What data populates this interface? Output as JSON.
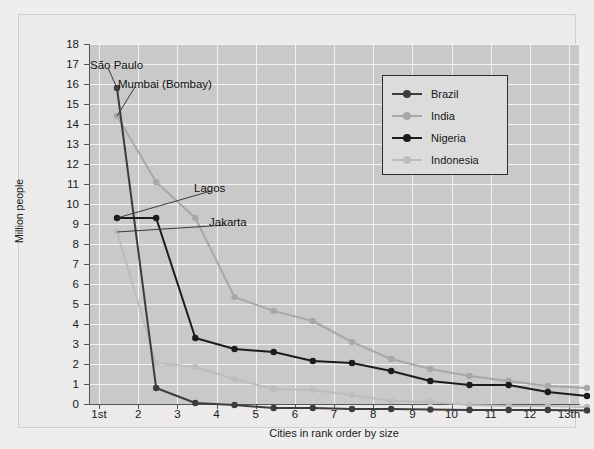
{
  "chart_data": {
    "type": "line",
    "title": "",
    "xlabel": "Cities in rank order by size",
    "ylabel": "Million people",
    "ylim": [
      0,
      18
    ],
    "ytick_step": 1,
    "grid": true,
    "legend_position": "upper-right",
    "categories": [
      "1st",
      "2",
      "3",
      "4",
      "5",
      "6",
      "7",
      "8",
      "9",
      "10",
      "11",
      "12",
      "13th"
    ],
    "series": [
      {
        "name": "Brazil",
        "color": "#3d3d3d",
        "values": [
          16.5,
          1.5,
          0.75,
          0.65,
          0.5,
          0.5,
          0.45,
          0.45,
          0.42,
          0.4,
          0.4,
          0.4,
          0.38
        ]
      },
      {
        "name": "India",
        "color": "#a8a8a8",
        "values": [
          15.1,
          11.8,
          10.0,
          6.05,
          5.35,
          4.85,
          3.8,
          2.95,
          2.45,
          2.1,
          1.85,
          1.6,
          1.5
        ]
      },
      {
        "name": "Nigeria",
        "color": "#1c1c1c",
        "values": [
          10.0,
          10.0,
          4.0,
          3.45,
          3.3,
          2.85,
          2.75,
          2.35,
          1.85,
          1.65,
          1.65,
          1.3,
          1.1
        ]
      },
      {
        "name": "Indonesia",
        "color": "#bdbdbd",
        "values": [
          9.3,
          2.75,
          2.55,
          1.95,
          1.45,
          1.4,
          1.15,
          0.85,
          0.8,
          0.65,
          0.6,
          0.6,
          0.55
        ]
      }
    ],
    "annotations": [
      {
        "text": "São Paulo",
        "series": "Brazil",
        "point_index": 0
      },
      {
        "text": "Mumbai (Bombay)",
        "series": "India",
        "point_index": 0
      },
      {
        "text": "Lagos",
        "series": "Nigeria",
        "point_index": 0
      },
      {
        "text": "Jakarta",
        "series": "Indonesia",
        "point_index": 0
      }
    ]
  },
  "ytick_labels": [
    "0",
    "1",
    "2",
    "3",
    "4",
    "5",
    "6",
    "7",
    "8",
    "9",
    "10",
    "11",
    "12",
    "13",
    "14",
    "15",
    "16",
    "17",
    "18"
  ],
  "legend": {
    "items": [
      {
        "label": "Brazil"
      },
      {
        "label": "India"
      },
      {
        "label": "Nigeria"
      },
      {
        "label": "Indonesia"
      }
    ]
  },
  "annotation_labels": {
    "sao_paulo": "São Paulo",
    "mumbai": "Mumbai (Bombay)",
    "lagos": "Lagos",
    "jakarta": "Jakarta"
  }
}
